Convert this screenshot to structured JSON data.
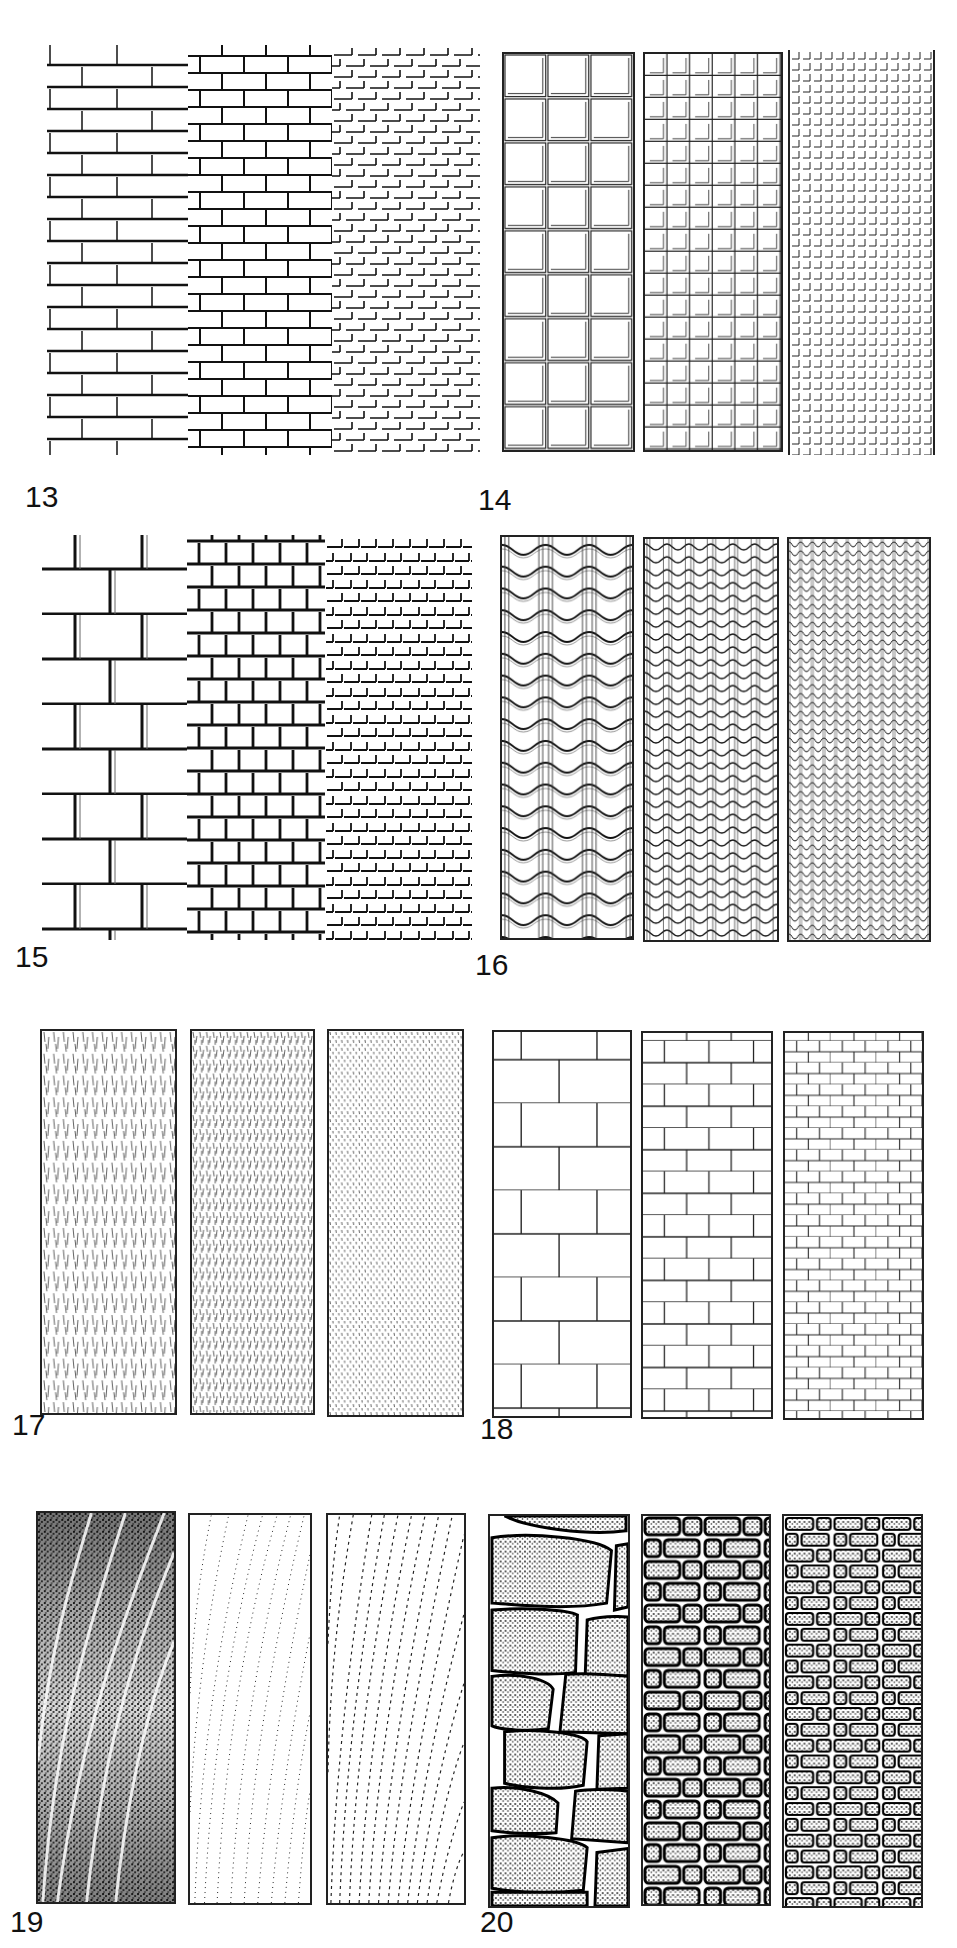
{
  "figures": [
    {
      "number": "13",
      "description": "Brick wall, stretcher bond, three scales",
      "panels": [
        "large bricks",
        "medium bricks",
        "small bricks"
      ]
    },
    {
      "number": "14",
      "description": "Square tile grid, three scales",
      "panels": [
        "3 columns",
        "6 columns",
        "13 columns"
      ]
    },
    {
      "number": "15",
      "description": "Shadowed brick bond, three scales",
      "panels": [
        "large",
        "medium",
        "small"
      ]
    },
    {
      "number": "16",
      "description": "Corrugated / wavy roof tile texture, three scales",
      "panels": [
        "large waves",
        "medium waves",
        "small waves"
      ]
    },
    {
      "number": "17",
      "description": "Short vertical stroke hatching texture, three densities",
      "panels": [
        "long strokes",
        "medium strokes",
        "dotted strokes"
      ]
    },
    {
      "number": "18",
      "description": "Outline block bond, three scales",
      "panels": [
        "large blocks",
        "medium blocks",
        "small blocks"
      ]
    },
    {
      "number": "19",
      "description": "Stippled wood-grain texture, three tones",
      "panels": [
        "dark stipple",
        "light dotted grain",
        "dashed grain"
      ]
    },
    {
      "number": "20",
      "description": "Stippled rubble stone masonry, three scales",
      "panels": [
        "large stones",
        "medium stones",
        "small stones"
      ]
    }
  ],
  "colors": {
    "ink": "#1a1a1a",
    "paper": "#ffffff"
  }
}
